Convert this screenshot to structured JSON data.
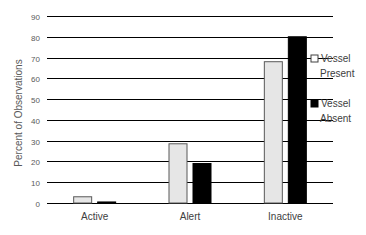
{
  "chart_data": {
    "type": "bar",
    "title": "",
    "xlabel": "",
    "ylabel": "Percent of Observations",
    "ylim": [
      0,
      90
    ],
    "yticks": [
      0,
      10,
      20,
      30,
      40,
      50,
      60,
      70,
      80,
      90
    ],
    "grid": true,
    "legend_position": "right",
    "categories": [
      "Active",
      "Alert",
      "Inactive"
    ],
    "series": [
      {
        "name": "Vessel Present",
        "legend_lines": [
          "Vessel",
          "Present"
        ],
        "color": "#e6e6e6",
        "stroke": "#595959",
        "values": [
          3,
          28.5,
          68
        ]
      },
      {
        "name": "Vessel Absent",
        "legend_lines": [
          "Vessel",
          "Absent"
        ],
        "color": "#000000",
        "stroke": "#000000",
        "values": [
          0.5,
          19,
          80
        ]
      }
    ]
  }
}
